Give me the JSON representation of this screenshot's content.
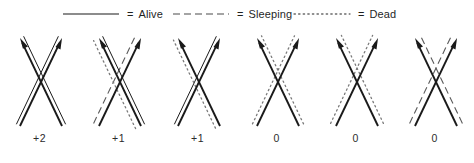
{
  "figure": {
    "width": 474,
    "height": 163,
    "background": "#ffffff",
    "ink": "#1a1a1a"
  },
  "legend": {
    "entries": [
      {
        "id": "alive",
        "style": "solid",
        "equals": "=",
        "label": "Alive",
        "sample_color": "#1a1a1a",
        "x": 62
      },
      {
        "id": "sleeping",
        "style": "dashed",
        "equals": "=",
        "label": "Sleeping",
        "sample_color": "#4a4a4a",
        "x": 172
      },
      {
        "id": "dead",
        "style": "dotted",
        "equals": "=",
        "label": "Dead",
        "sample_color": "#6a6a6a",
        "x": 293
      }
    ]
  },
  "chart_data": {
    "type": "diagram",
    "categories": [
      "+2",
      "+1",
      "+1",
      "0",
      "0",
      "0"
    ],
    "values": [
      2,
      1,
      1,
      0,
      0,
      0
    ],
    "legend_position": "top",
    "line_styles": [
      "solid",
      "dashed",
      "dotted"
    ],
    "cells": [
      {
        "index": 0,
        "score": "+2",
        "arrows": [
          {
            "direction": "up-right",
            "style": "solid",
            "state": "alive"
          },
          {
            "direction": "up-left",
            "style": "solid",
            "state": "alive"
          }
        ],
        "companions": [
          {
            "parallel_to": "up-right",
            "style": "solid",
            "state": "alive",
            "offset": -4
          },
          {
            "parallel_to": "up-left",
            "style": "solid",
            "state": "alive",
            "offset": 4
          },
          {
            "parallel_to": "up-right",
            "style": "dotted",
            "state": "dead",
            "offset": 0,
            "partial": true
          }
        ]
      },
      {
        "index": 1,
        "score": "+1",
        "arrows": [
          {
            "direction": "up-right",
            "style": "solid",
            "state": "alive"
          },
          {
            "direction": "up-left",
            "style": "solid",
            "state": "alive"
          }
        ],
        "companions": [
          {
            "parallel_to": "up-right",
            "style": "dashed",
            "state": "sleeping",
            "offset": -6
          },
          {
            "parallel_to": "up-left",
            "style": "solid",
            "state": "alive",
            "offset": 4
          },
          {
            "parallel_to": "up-left",
            "style": "dotted",
            "state": "dead",
            "offset": -6
          }
        ]
      },
      {
        "index": 2,
        "score": "+1",
        "arrows": [
          {
            "direction": "up-right",
            "style": "solid",
            "state": "alive"
          },
          {
            "direction": "up-left",
            "style": "solid",
            "state": "alive"
          }
        ],
        "companions": [
          {
            "parallel_to": "up-right",
            "style": "solid",
            "state": "alive",
            "offset": -4
          },
          {
            "parallel_to": "up-left",
            "style": "dotted",
            "state": "dead",
            "offset": -5
          }
        ]
      },
      {
        "index": 3,
        "score": "0",
        "arrows": [
          {
            "direction": "up-right",
            "style": "solid",
            "state": "alive"
          },
          {
            "direction": "up-left",
            "style": "solid",
            "state": "alive"
          }
        ],
        "companions": [
          {
            "parallel_to": "up-right",
            "style": "dotted",
            "state": "dead",
            "offset": -5
          },
          {
            "parallel_to": "up-left",
            "style": "dotted",
            "state": "dead",
            "offset": 5
          }
        ]
      },
      {
        "index": 4,
        "score": "0",
        "arrows": [
          {
            "direction": "up-right",
            "style": "solid",
            "state": "alive"
          },
          {
            "direction": "up-left",
            "style": "solid",
            "state": "alive"
          }
        ],
        "companions": [
          {
            "parallel_to": "up-right",
            "style": "dotted",
            "state": "dead",
            "offset": -6
          },
          {
            "parallel_to": "up-left",
            "style": "dotted",
            "state": "dead",
            "offset": 6
          }
        ]
      },
      {
        "index": 5,
        "score": "0",
        "arrows": [
          {
            "direction": "up-right",
            "style": "solid",
            "state": "alive"
          },
          {
            "direction": "up-left",
            "style": "solid",
            "state": "alive"
          }
        ],
        "companions": [
          {
            "parallel_to": "up-right",
            "style": "dashed",
            "state": "sleeping",
            "offset": -6
          },
          {
            "parallel_to": "up-left",
            "style": "dashed",
            "state": "sleeping",
            "offset": 6
          }
        ]
      }
    ]
  }
}
